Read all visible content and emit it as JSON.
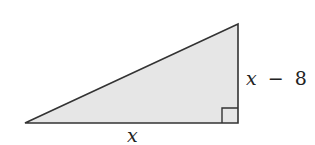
{
  "diagram": {
    "type": "right-triangle",
    "fill_color": "#e6e6e6",
    "stroke_color": "#333333",
    "vertices": {
      "bottom_left": [
        25,
        123
      ],
      "bottom_right": [
        238,
        123
      ],
      "top_right": [
        238,
        24
      ]
    },
    "right_angle_at": "bottom_right",
    "labels": {
      "base": "x",
      "height_var": "x",
      "height_op": "−",
      "height_const": "8"
    }
  }
}
